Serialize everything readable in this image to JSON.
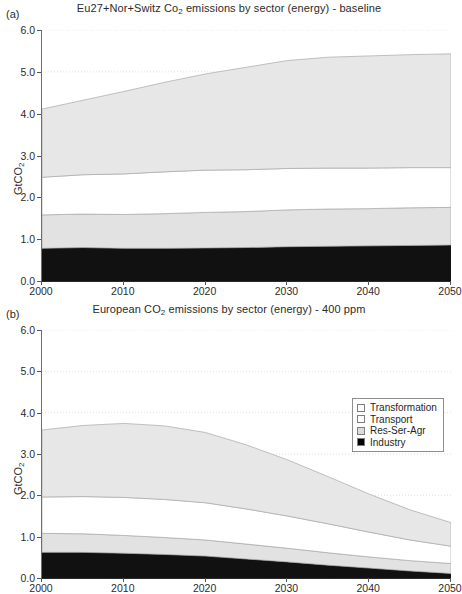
{
  "figure": {
    "ylabel": "GtCO",
    "ylabel_sub": "2",
    "ytick_labels": [
      "0.0",
      "1.0",
      "2.0",
      "3.0",
      "4.0",
      "5.0",
      "6.0"
    ],
    "xtick_labels": [
      "2000",
      "2010",
      "2020",
      "2030",
      "2040",
      "2050"
    ]
  },
  "panels": [
    {
      "letter": "(a)",
      "title_pre": "Eu27+Nor+Switz Co",
      "title_sub": "2",
      "title_post": " emissions by sector (energy) - baseline"
    },
    {
      "letter": "(b)",
      "title_pre": "European CO",
      "title_sub": "2",
      "title_post": " emissions by sector (energy) - 400 ppm"
    }
  ],
  "legend": {
    "items": [
      {
        "label": "Transformation",
        "color": "#fcfcfc"
      },
      {
        "label": "Transport",
        "color": "#ffffff"
      },
      {
        "label": "Res-Ser-Agr",
        "color": "#dcdcdc"
      },
      {
        "label": "Industry",
        "color": "#000000"
      }
    ]
  },
  "colors": {
    "industry": "#111111",
    "res_ser_agr": "#e2e2e2",
    "transport": "#ffffff",
    "transformation": "#e7e7e7",
    "band_edge": "#a8a8a8",
    "grid": "#d8d8d8",
    "axis": "#444444"
  },
  "chart_data": [
    {
      "type": "area",
      "stacked": true,
      "panel": "(a)",
      "title": "Eu27+Nor+Switz Co2 emissions by sector (energy) - baseline",
      "xlabel": "",
      "ylabel": "GtCO2",
      "xlim": [
        2000,
        2050
      ],
      "ylim": [
        0,
        6
      ],
      "yticks": [
        0,
        1,
        2,
        3,
        4,
        5,
        6
      ],
      "xticks": [
        2000,
        2010,
        2020,
        2030,
        2040,
        2050
      ],
      "grid": true,
      "legend_position": "none",
      "x": [
        2000,
        2005,
        2010,
        2015,
        2020,
        2025,
        2030,
        2035,
        2040,
        2045,
        2050
      ],
      "series": [
        {
          "name": "Industry",
          "values": [
            0.78,
            0.8,
            0.78,
            0.78,
            0.79,
            0.8,
            0.82,
            0.83,
            0.84,
            0.85,
            0.86
          ]
        },
        {
          "name": "Res-Ser-Agr",
          "values": [
            0.8,
            0.8,
            0.81,
            0.83,
            0.85,
            0.86,
            0.88,
            0.89,
            0.89,
            0.9,
            0.9
          ]
        },
        {
          "name": "Transport",
          "values": [
            0.9,
            0.94,
            0.97,
            1.0,
            1.01,
            1.0,
            0.99,
            0.98,
            0.97,
            0.96,
            0.95
          ]
        },
        {
          "name": "Transformation",
          "values": [
            1.63,
            1.78,
            1.97,
            2.14,
            2.3,
            2.45,
            2.58,
            2.65,
            2.68,
            2.7,
            2.72
          ]
        }
      ],
      "cumulative_top": [
        4.11,
        4.32,
        4.53,
        4.75,
        4.95,
        5.11,
        5.27,
        5.35,
        5.38,
        5.41,
        5.43
      ]
    },
    {
      "type": "area",
      "stacked": true,
      "panel": "(b)",
      "title": "European CO2 emissions by sector (energy) - 400 ppm",
      "xlabel": "",
      "ylabel": "GtCO2",
      "xlim": [
        2000,
        2050
      ],
      "ylim": [
        0,
        6
      ],
      "yticks": [
        0,
        1,
        2,
        3,
        4,
        5,
        6
      ],
      "xticks": [
        2000,
        2010,
        2020,
        2030,
        2040,
        2050
      ],
      "grid": true,
      "legend_position": "upper right",
      "x": [
        2000,
        2005,
        2010,
        2015,
        2020,
        2025,
        2030,
        2035,
        2040,
        2045,
        2050
      ],
      "series": [
        {
          "name": "Industry",
          "values": [
            0.62,
            0.62,
            0.6,
            0.57,
            0.53,
            0.46,
            0.39,
            0.31,
            0.24,
            0.17,
            0.11
          ]
        },
        {
          "name": "Res-Ser-Agr",
          "values": [
            0.46,
            0.45,
            0.43,
            0.41,
            0.39,
            0.36,
            0.33,
            0.3,
            0.27,
            0.25,
            0.24
          ]
        },
        {
          "name": "Transport",
          "values": [
            0.88,
            0.9,
            0.92,
            0.92,
            0.9,
            0.85,
            0.78,
            0.7,
            0.6,
            0.5,
            0.42
          ]
        },
        {
          "name": "Transformation",
          "values": [
            1.62,
            1.72,
            1.79,
            1.78,
            1.7,
            1.55,
            1.36,
            1.14,
            0.92,
            0.73,
            0.57
          ]
        }
      ],
      "cumulative_top": [
        3.58,
        3.69,
        3.74,
        3.68,
        3.52,
        3.22,
        2.86,
        2.45,
        2.03,
        1.65,
        1.34
      ]
    }
  ]
}
